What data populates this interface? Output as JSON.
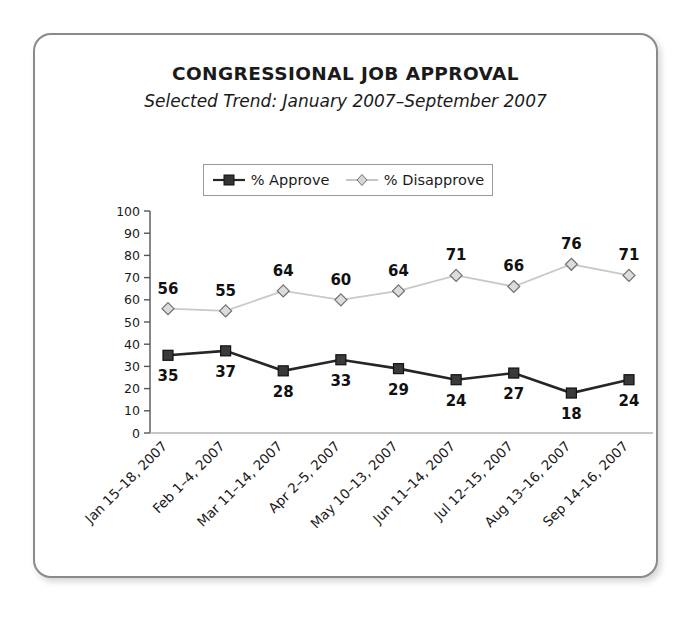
{
  "card": {
    "border_color": "#8a8a8a"
  },
  "chart_data": {
    "type": "line",
    "title": "CONGRESSIONAL JOB APPROVAL",
    "subtitle": "Selected Trend: January 2007–September 2007",
    "xlabel": "",
    "ylabel": "",
    "ylim": [
      0,
      100
    ],
    "ytick_step": 10,
    "yticks": [
      100,
      90,
      80,
      70,
      60,
      50,
      40,
      30,
      20,
      10,
      0
    ],
    "grid": false,
    "legend_position": "top-center",
    "categories": [
      "Jan 15–18, 2007",
      "Feb 1–4, 2007",
      "Mar 11–14, 2007",
      "Apr 2–5, 2007",
      "May 10–13, 2007",
      "Jun 11–14, 2007",
      "Jul 12–15, 2007",
      "Aug 13–16, 2007",
      "Sep 14–16, 2007"
    ],
    "series": [
      {
        "name": "% Approve",
        "values": [
          35,
          37,
          28,
          33,
          29,
          24,
          27,
          18,
          24
        ],
        "color": "#262626",
        "marker": "square-filled",
        "label_position": "below"
      },
      {
        "name": "% Disapprove",
        "values": [
          56,
          55,
          64,
          60,
          64,
          71,
          66,
          76,
          71
        ],
        "color": "#c8c8c8",
        "marker": "diamond-open",
        "label_position": "above"
      }
    ]
  }
}
